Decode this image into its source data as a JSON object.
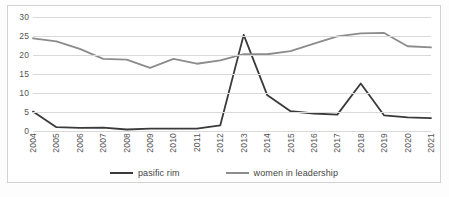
{
  "chart_data": {
    "type": "line",
    "title": "",
    "xlabel": "",
    "ylabel": "",
    "ylim": [
      0,
      30
    ],
    "ytick_step": 5,
    "yticks": [
      "0",
      "5",
      "10",
      "15",
      "20",
      "25",
      "30"
    ],
    "grid": true,
    "legend_position": "bottom",
    "categories": [
      "2004",
      "2005",
      "2006",
      "2007",
      "2008",
      "2009",
      "2010",
      "2011",
      "2012",
      "2013",
      "2014",
      "2015",
      "2016",
      "2017",
      "2018",
      "2019",
      "2020",
      "2021"
    ],
    "series": [
      {
        "name": "pasific rim",
        "color": "#3a3a3a",
        "values": [
          5.1,
          1.0,
          0.8,
          0.9,
          0.4,
          0.6,
          0.6,
          0.6,
          1.5,
          25.3,
          9.5,
          5.2,
          4.6,
          4.3,
          12.5,
          4.1,
          3.6,
          3.4
        ]
      },
      {
        "name": "women in leadership",
        "color": "#8c8c8c",
        "values": [
          24.4,
          23.6,
          21.6,
          19.0,
          18.8,
          16.6,
          19.0,
          17.7,
          18.6,
          20.2,
          20.2,
          21.0,
          23.0,
          24.9,
          25.7,
          25.8,
          22.3,
          22.0
        ]
      }
    ]
  },
  "legend": {
    "items": [
      {
        "label": "pasific rim",
        "color": "#3a3a3a"
      },
      {
        "label": "women in leadership",
        "color": "#8c8c8c"
      }
    ]
  }
}
